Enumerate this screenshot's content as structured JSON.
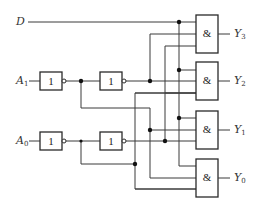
{
  "diagram": {
    "type": "2-to-4 line decoder / demultiplexer logic circuit",
    "inputs": {
      "data": {
        "name": "D",
        "sub": ""
      },
      "a1": {
        "name": "A",
        "sub": "1"
      },
      "a0": {
        "name": "A",
        "sub": "0"
      }
    },
    "inverter_symbol": "1",
    "and_symbol": "&",
    "outputs": [
      {
        "name": "Y",
        "sub": "3"
      },
      {
        "name": "Y",
        "sub": "2"
      },
      {
        "name": "Y",
        "sub": "1"
      },
      {
        "name": "Y",
        "sub": "0"
      }
    ],
    "colors": {
      "line": "#3a3a3a",
      "background": "#ffffff"
    }
  }
}
